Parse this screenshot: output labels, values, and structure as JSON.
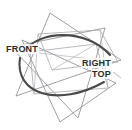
{
  "figure": {
    "background_color": "#ffffff",
    "width": 132,
    "height": 130,
    "labels": [
      {
        "id": "front",
        "text": "FRONT",
        "x": 5,
        "y": 44,
        "color": "#2b2b2b"
      },
      {
        "id": "right",
        "text": "RIGHT",
        "x": 81,
        "y": 58,
        "color": "#2b2b2b"
      },
      {
        "id": "top",
        "text": "TOP",
        "x": 91,
        "y": 69,
        "color": "#2b2b2b"
      }
    ],
    "stroke_colors": {
      "thin_line": "#8f8f95",
      "thin_line_light": "#a8a8ae",
      "thick_arc": "#4a4a4a"
    },
    "geometry": {
      "description": "Three overlapping elongated triangles forming a star outline, a central heptagon-like intersection region, and two heavy arcs of a large circle.",
      "triangles": [
        {
          "id": "triangle-1",
          "points": "50,13 16,96 121,60"
        },
        {
          "id": "triangle-2",
          "points": "105,28 78,118 11,47"
        },
        {
          "id": "triangle-3",
          "points": "22,40 116,83 60,122"
        }
      ],
      "quads": [
        {
          "id": "quad-1",
          "points": "38,34 100,30 118,62 52,70"
        },
        {
          "id": "quad-2",
          "points": "30,52 96,44 108,88 34,94"
        }
      ],
      "arcs": [
        {
          "id": "arc-upper",
          "path": "M 24,52 C 38,30 86,28 110,55",
          "stroke_width": 2.1
        },
        {
          "id": "arc-lower",
          "path": "M 20,58 C 14,94 58,108 104,82",
          "stroke_width": 2.1
        }
      ],
      "circle_hint": {
        "cx": 66,
        "cy": 66,
        "r": 45
      }
    }
  }
}
